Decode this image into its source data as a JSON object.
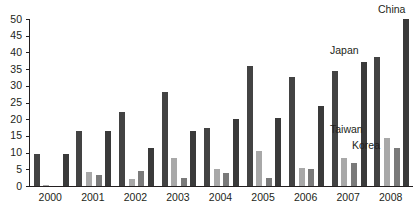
{
  "chart_data": {
    "type": "bar",
    "title": "",
    "subtitle": "",
    "xlabel": "",
    "ylabel": "",
    "categories": [
      "2000",
      "2001",
      "2002",
      "2003",
      "2004",
      "2005",
      "2006",
      "2007",
      "2008"
    ],
    "ylim": [
      0,
      50
    ],
    "y_ticks": [
      0,
      5,
      10,
      15,
      20,
      25,
      30,
      35,
      40,
      45,
      50
    ],
    "y_tick_labels": [
      "0",
      "5",
      "10",
      "15",
      "20",
      "25",
      "30",
      "35",
      "40",
      "45",
      "50"
    ],
    "grid": false,
    "legend_position": "in-plot-annotations",
    "series": [
      {
        "name": "Japan",
        "color": "#434343",
        "values": [
          9.5,
          16.5,
          22.3,
          28.0,
          17.5,
          36.0,
          32.5,
          34.5,
          38.5
        ]
      },
      {
        "name": "Taiwan",
        "color": "#a8a8a8",
        "values": [
          0.3,
          4.3,
          2.2,
          8.3,
          5.0,
          10.5,
          5.3,
          8.5,
          14.5
        ]
      },
      {
        "name": "Korea",
        "color": "#7a7a7a",
        "values": [
          0.0,
          3.3,
          4.5,
          2.3,
          4.0,
          2.5,
          5.0,
          7.0,
          11.5
        ]
      },
      {
        "name": "China",
        "color": "#3a3a3a",
        "values": [
          9.5,
          16.5,
          11.3,
          16.5,
          20.0,
          20.5,
          24.0,
          37.0,
          50.0
        ]
      }
    ],
    "annotations": [
      {
        "label": "China",
        "x_px": 378,
        "y_px": 4
      },
      {
        "label": "Japan",
        "x_px": 330,
        "y_px": 45
      },
      {
        "label": "Taiwan",
        "x_px": 330,
        "y_px": 124
      },
      {
        "label": "Korea",
        "x_px": 352,
        "y_px": 140
      }
    ]
  }
}
